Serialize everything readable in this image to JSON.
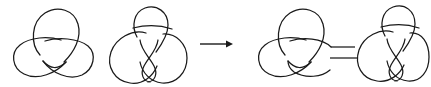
{
  "figure": {
    "background_color": "#ffffff",
    "stroke_color": "#1a1a1a",
    "stroke_width": 1.25,
    "width": 431,
    "height": 87
  },
  "operands": [
    {
      "id": "trefoil-left",
      "label": "trefoil knot",
      "crossing_number": 3,
      "bbox": [
        13,
        10,
        82,
        68
      ]
    },
    {
      "id": "figure-eight-left",
      "label": "figure-eight knot",
      "crossing_number": 4,
      "bbox": [
        108,
        6,
        78,
        78
      ]
    }
  ],
  "operator": {
    "id": "arrow",
    "symbol": "→",
    "name": "rightwards-arrow",
    "x1": 200,
    "x2": 233,
    "y": 44
  },
  "result": {
    "id": "connected-sum",
    "label": "connected sum",
    "bbox": [
      258,
      6,
      170,
      78
    ],
    "components": [
      {
        "id": "trefoil-right",
        "label": "trefoil knot",
        "bbox": [
          258,
          10,
          82,
          68
        ]
      },
      {
        "id": "figure-eight-right",
        "label": "figure-eight knot",
        "bbox": [
          355,
          6,
          73,
          78
        ]
      }
    ],
    "band": {
      "id": "connecting-band",
      "label": "connecting band",
      "x1": 316,
      "x2": 354,
      "y_top": 48,
      "y_bottom": 58
    }
  }
}
